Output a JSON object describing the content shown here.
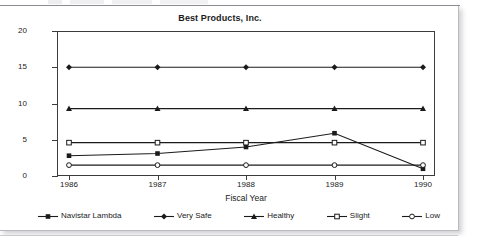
{
  "chart_data": {
    "type": "line",
    "title": "Best Products, Inc.",
    "xlabel": "Fiscal Year",
    "ylabel": "",
    "categories": [
      "1986",
      "1987",
      "1988",
      "1989",
      "1990"
    ],
    "x": [
      1986,
      1987,
      1988,
      1989,
      1990
    ],
    "ylim": [
      0,
      20
    ],
    "yticks": [
      0,
      5,
      10,
      15,
      20
    ],
    "ytick_labels": [
      "0",
      "5",
      "10",
      "15",
      "20"
    ],
    "grid": false,
    "legend_position": "bottom",
    "series": [
      {
        "name": "Navistar Lambda",
        "marker": "filled-square",
        "values": [
          2.8,
          3.1,
          4.0,
          5.9,
          1.0
        ]
      },
      {
        "name": "Very Safe",
        "marker": "filled-diamond",
        "values": [
          15.0,
          15.0,
          15.0,
          15.0,
          15.0
        ]
      },
      {
        "name": "Healthy",
        "marker": "filled-triangle",
        "values": [
          9.3,
          9.3,
          9.3,
          9.3,
          9.3
        ]
      },
      {
        "name": "Slight",
        "marker": "open-square",
        "values": [
          4.6,
          4.6,
          4.6,
          4.6,
          4.6
        ]
      },
      {
        "name": "Low",
        "marker": "open-circle",
        "values": [
          1.5,
          1.5,
          1.5,
          1.5,
          1.5
        ]
      }
    ],
    "line_color": "#1b1b1b",
    "plot_background": "#ffffff"
  },
  "legend": {
    "items": [
      {
        "label": "Navistar Lambda",
        "marker": "filled-square"
      },
      {
        "label": "Very Safe",
        "marker": "filled-diamond"
      },
      {
        "label": "Healthy",
        "marker": "filled-triangle"
      },
      {
        "label": "Slight",
        "marker": "open-square"
      },
      {
        "label": "Low",
        "marker": "open-circle"
      }
    ]
  }
}
